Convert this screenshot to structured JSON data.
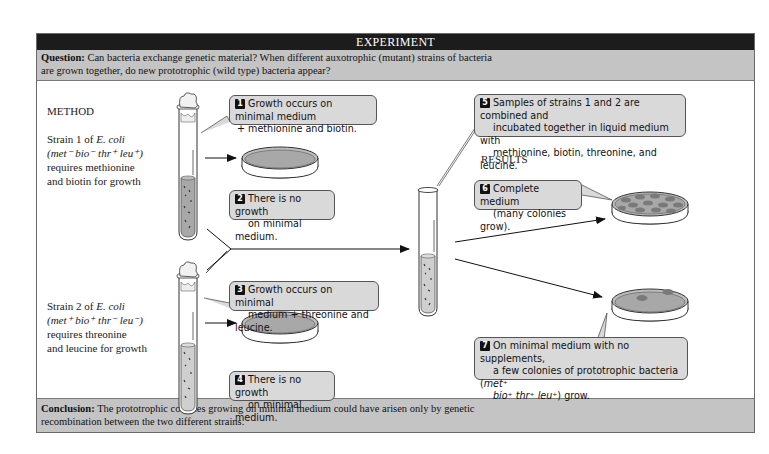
{
  "header": {
    "title": "EXPERIMENT"
  },
  "question": {
    "label": "Question:",
    "line1": "Can bacteria exchange genetic material? When different auxotrophic (mutant) strains of bacteria",
    "line2": "are grown together, do new prototrophic (wild type) bacteria appear?"
  },
  "method": {
    "title": "METHOD"
  },
  "results": {
    "title": "RESULTS"
  },
  "strain1": {
    "line1_a": "Strain 1 of ",
    "line1_b": "E. coli",
    "genotype": "(met⁻ bio⁻ thr⁺ leu⁺)",
    "line3": "requires methionine",
    "line4": "and biotin for growth"
  },
  "strain2": {
    "line1_a": "Strain 2 of ",
    "line1_b": "E. coli",
    "genotype": "(met⁺ bio⁺ thr⁻ leu⁻)",
    "line3": "requires threonine",
    "line4": "and leucine for growth"
  },
  "steps": [
    {
      "num": "1",
      "line1": "Growth occurs on minimal medium",
      "line2": "+ methionine and biotin."
    },
    {
      "num": "2",
      "line1": "There is no growth",
      "line2": "on minimal medium."
    },
    {
      "num": "3",
      "line1": "Growth occurs on minimal",
      "line2": "medium + threonine and leucine."
    },
    {
      "num": "4",
      "line1": "There is no growth",
      "line2": "on minimal medium."
    },
    {
      "num": "5",
      "line1": "Samples of strains 1 and 2 are combined and",
      "line2": "incubated together in liquid medium with",
      "line3": "methionine, biotin, threonine, and leucine."
    },
    {
      "num": "6",
      "line1": "Complete medium",
      "line2": "(many colonies grow)."
    },
    {
      "num": "7",
      "line1": "On minimal medium with no supplements,",
      "line2a": "a few colonies of prototrophic bacteria (",
      "line2b": "met⁺",
      "line3a": "bio⁺ thr⁺ leu⁺",
      "line3b": ") grow."
    }
  ],
  "conclusion": {
    "label": "Conclusion:",
    "line1": "The prototrophic colonies growing on minimal medium could have arisen only by genetic",
    "line2": "recombination between the two different strains."
  },
  "colors": {
    "header_bg": "#1c1c1c",
    "band_bg": "#c4c4c4",
    "callout_bg": "#d9d9d9",
    "medium": "#a8a8a8",
    "colony": "#7a7a7a"
  }
}
